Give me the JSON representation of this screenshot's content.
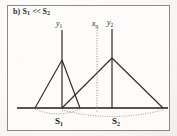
{
  "figure": {
    "caption": {
      "part_label": "b)",
      "left_symbol": "S",
      "left_sub": "1",
      "relation": "<<",
      "right_symbol": "S",
      "right_sub": "2",
      "full_text": "b) S1 << S2"
    },
    "frame": {
      "border_color": "#8d8a86",
      "background_color": "#fdfcfa"
    },
    "colors": {
      "line": "#2b2825",
      "baseline": "#1f1d1b",
      "dotted": "#8e8a85",
      "text": "#26231f"
    },
    "axis_labels": [
      {
        "id": "y1",
        "symbol": "y",
        "sub": "1",
        "x": 62
      },
      {
        "id": "xq",
        "symbol": "x",
        "sub": "q",
        "x": 97
      },
      {
        "id": "y2",
        "symbol": "y",
        "sub": "2",
        "x": 112
      }
    ],
    "span_labels": [
      {
        "id": "s1",
        "symbol": "S",
        "sub": "1"
      },
      {
        "id": "s2",
        "symbol": "S",
        "sub": "2"
      }
    ],
    "geometry": {
      "baseline_y": 108,
      "baseline_x_start": 17,
      "baseline_x_end": 168,
      "triangles": [
        {
          "name": "triangle-s1",
          "apex_x": 62,
          "apex_y": 60,
          "base_left_x": 35,
          "base_right_x": 80,
          "stem_top_y": 30
        },
        {
          "name": "triangle-s2",
          "apex_x": 112,
          "apex_y": 58,
          "base_left_x": 62,
          "base_right_x": 163,
          "stem_top_y": 29
        }
      ],
      "dotted_vertical": {
        "x": 97,
        "y_top": 30,
        "y_bottom": 112
      },
      "dotted_arcs": [
        {
          "name": "arc-s1",
          "x_start": 35,
          "x_end": 80,
          "sag": 8
        },
        {
          "name": "arc-s2",
          "x_start": 62,
          "x_end": 163,
          "sag": 10
        }
      ]
    }
  }
}
